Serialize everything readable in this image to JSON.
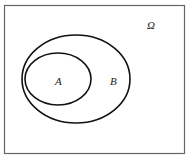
{
  "diagram": {
    "type": "venn",
    "universe_label": "Ω",
    "sets": [
      {
        "label": "B",
        "contains": [
          "A"
        ]
      },
      {
        "label": "A"
      }
    ],
    "colors": {
      "stroke": "#111111",
      "frame": "#555555",
      "background": "#ffffff"
    }
  }
}
